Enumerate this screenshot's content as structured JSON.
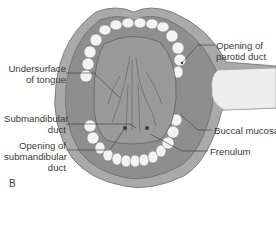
{
  "figure": {
    "panel_label": "B",
    "labels": [
      {
        "id": "undersurface",
        "line1": "Undersurface",
        "line2": "of tongue"
      },
      {
        "id": "submandibular-duct",
        "line1": "Submandibular",
        "line2": "duct"
      },
      {
        "id": "opening-submandibular",
        "line1": "Opening of",
        "line2": "submandibular",
        "line3": "duct"
      },
      {
        "id": "opening-parotid",
        "line1": "Opening of",
        "line2": "parotid duct"
      },
      {
        "id": "buccal-mucosa",
        "line1": "Buccal mucosa"
      },
      {
        "id": "frenulum",
        "line1": "Frenulum"
      }
    ],
    "colors": {
      "lip": "#a9a9a9",
      "lip_dark": "#7d7d7d",
      "mucosa": "#8e8e8e",
      "tongue": "#9a9a9a",
      "teeth": "#f3f3f3",
      "retractor": "#ededed",
      "leader": "#3a3a3a"
    }
  }
}
